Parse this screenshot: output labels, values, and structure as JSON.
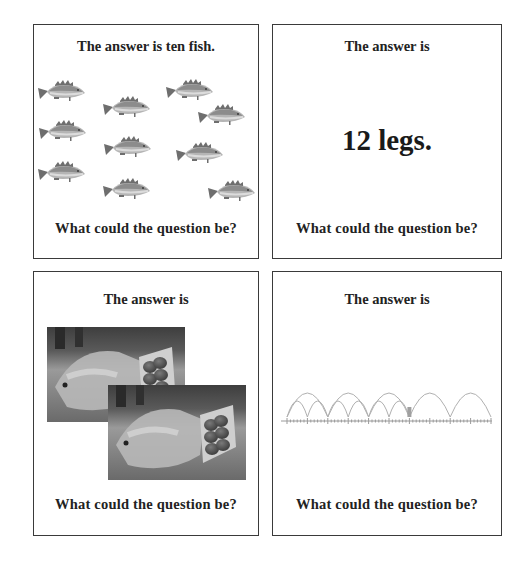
{
  "cards": [
    {
      "id": "fish",
      "title": "The answer is ten fish.",
      "question": "What could the question be?",
      "fish_count": 10,
      "fish_positions": [
        [
          62,
          91
        ],
        [
          127,
          107
        ],
        [
          190,
          90
        ],
        [
          222,
          115
        ],
        [
          63,
          131
        ],
        [
          128,
          147
        ],
        [
          200,
          153
        ],
        [
          62,
          172
        ],
        [
          127,
          189
        ],
        [
          232,
          191
        ]
      ]
    },
    {
      "id": "legs",
      "title": "The answer is",
      "answer": "12 legs.",
      "question": "What could the question be?"
    },
    {
      "id": "eggs",
      "title": "The answer is",
      "question": "What could the question be?",
      "images": [
        "egg-carton-photo",
        "egg-carton-photo"
      ]
    },
    {
      "id": "number-line",
      "title": "The answer is",
      "question": "What could the question be?",
      "number_line": {
        "large_jumps": 5,
        "small_jumps": 6
      }
    }
  ],
  "colors": {
    "border": "#3a3a3a",
    "text": "#222222",
    "fish_body": "#b5b5b5",
    "fish_dark": "#6e6e6e",
    "arc": "#b0b0b0"
  }
}
